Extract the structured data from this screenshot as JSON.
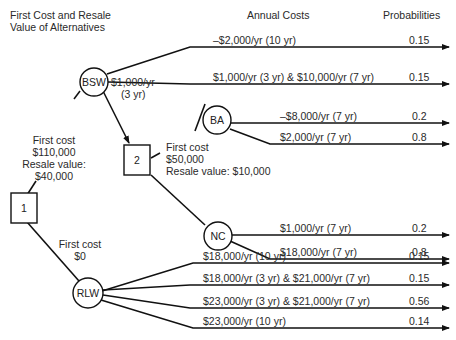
{
  "headers": {
    "alternatives": [
      "First Cost and Resale",
      "Value of Alternatives"
    ],
    "annual_costs": "Annual Costs",
    "probabilities": "Probabilities"
  },
  "decision_nodes": [
    {
      "id": "1",
      "label": "1"
    },
    {
      "id": "2",
      "label": "2"
    }
  ],
  "chance_nodes": {
    "bsw": "BSW",
    "ba": "BA",
    "nc": "NC",
    "rlw": "RLW"
  },
  "annotations": {
    "bsw_cost": [
      "First cost",
      "$110,000",
      "Resale value:",
      "$40,000"
    ],
    "bsw_to_2": [
      "$1,000/yr",
      "(3 yr)"
    ],
    "node2_cost": [
      "First cost",
      "$50,000",
      "Resale value: $10,000"
    ],
    "rlw_cost": [
      "First cost",
      "$0"
    ]
  },
  "branches": [
    {
      "from": "BSW",
      "label": "–$2,000/yr (10 yr)",
      "probability": "0.15"
    },
    {
      "from": "BSW",
      "label": "$1,000/yr (3 yr) & $10,000/yr (7 yr)",
      "probability": "0.15"
    },
    {
      "from": "BA",
      "label": "–$8,000/yr (7 yr)",
      "probability": "0.2"
    },
    {
      "from": "BA",
      "label": "$2,000/yr (7 yr)",
      "probability": "0.8"
    },
    {
      "from": "NC",
      "label": "$1,000/yr (7 yr)",
      "probability": "0.2"
    },
    {
      "from": "NC",
      "label": "$18,000/yr (7 yr)",
      "probability": "0.8"
    },
    {
      "from": "RLW",
      "label": "$18,000/yr (10 yr)",
      "probability": "0.15"
    },
    {
      "from": "RLW",
      "label": "$18,000/yr (3 yr) & $21,000/yr (7 yr)",
      "probability": "0.15"
    },
    {
      "from": "RLW",
      "label": "$23,000/yr (3 yr) & $21,000/yr (7 yr)",
      "probability": "0.56"
    },
    {
      "from": "RLW",
      "label": "$23,000/yr (10 yr)",
      "probability": "0.14"
    }
  ]
}
